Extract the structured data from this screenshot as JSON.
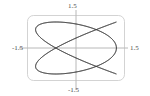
{
  "chart_data": {
    "type": "line",
    "title": "",
    "subtitle": "",
    "xlabel": "",
    "ylabel": "",
    "xlim": [
      -1.5,
      1.5
    ],
    "ylim": [
      -1.5,
      1.5
    ],
    "grid": false,
    "legend": null,
    "curve_description": "Lissajous parametric curve",
    "parametric": {
      "x_expression": "cos(4t)",
      "y_expression": "sin(3t)",
      "x_amplitude": 1.25,
      "y_amplitude": 1.2,
      "x_frequency": 4,
      "y_frequency": 3,
      "phase": 0,
      "t_range": [
        0,
        6.283185307179586
      ],
      "samples": 1200
    },
    "series": [
      {
        "name": "lissajous",
        "color": "#3a3a3a",
        "line_width": 0.7
      }
    ],
    "axes": {
      "x_axis_color": "#b8b8b8",
      "y_axis_color": "#b8b8b8",
      "frame_color": "#c8c8c8",
      "frame_rounded": true
    },
    "tick_labels": {
      "top": "1.5",
      "left": "-1.5",
      "right": "1.5",
      "bottom": "-1.5"
    },
    "categories": [],
    "values": []
  },
  "labels": {
    "top": "1.5",
    "left": "-1.5",
    "right": "1.5",
    "bottom": "-1.5"
  },
  "colors": {
    "curve": "#3a3a3a",
    "axis": "#b8b8b8",
    "frame": "#c8c8c8",
    "text": "#4a4a4a",
    "background": "#ffffff"
  }
}
